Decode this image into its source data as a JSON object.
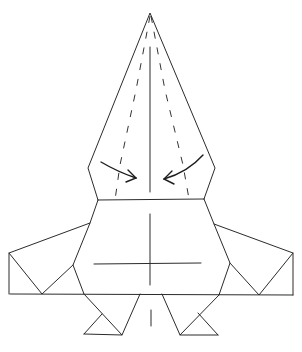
{
  "diagram": {
    "type": "origami-fold-step",
    "colors": {
      "line": "#2b2b2b",
      "background": "#ffffff"
    },
    "elements": {
      "apex": "top point",
      "upper_flap": "kite flap with dashed valley folds",
      "arrows": [
        "fold-left-arrow",
        "fold-right-arrow"
      ],
      "body": "central octagonal body with cross mark",
      "wings": [
        "left-wing",
        "right-wing"
      ],
      "feet": [
        "left-foot",
        "right-foot"
      ]
    }
  }
}
